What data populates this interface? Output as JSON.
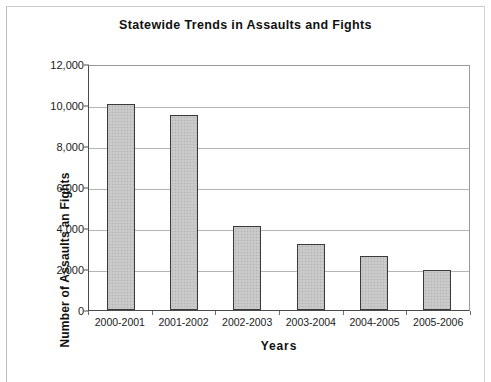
{
  "chart_data": {
    "type": "bar",
    "title": "Statewide Trends in Assaults and Fights",
    "xlabel": "Years",
    "ylabel": "Number of Assaults an Fights",
    "categories": [
      "2000-2001",
      "2001-2002",
      "2002-2003",
      "2003-2004",
      "2004-2005",
      "2005-2006"
    ],
    "values": [
      10050,
      9500,
      4100,
      3200,
      2650,
      1950
    ],
    "series": [
      {
        "name": "Assaults and Fights",
        "values": [
          10050,
          9500,
          4100,
          3200,
          2650,
          1950
        ]
      }
    ],
    "ylim": [
      0,
      12000
    ],
    "ytick_values": [
      0,
      2000,
      4000,
      6000,
      8000,
      10000,
      12000
    ],
    "ytick_labels": [
      "0",
      "2,000",
      "4,000",
      "6,000",
      "8,000",
      "10,000",
      "12,000"
    ],
    "grid": true,
    "legend": false,
    "legend_position": "none",
    "bar_fill_color": "#c6c6c6",
    "bar_edge_color": "#3a3a3a",
    "gridline_color": "#b4b4b4",
    "axis_color": "#4a4a4a",
    "background_color": "#ffffff"
  }
}
